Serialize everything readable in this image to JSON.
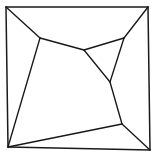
{
  "figure": {
    "background_color": "#ffffff",
    "line_color": "#181818",
    "line_width": 1.35,
    "canvas": {
      "width": 156,
      "height": 155
    }
  },
  "chart_data": {
    "type": "diagram",
    "subtype": "planar-graph",
    "xlabel": "",
    "ylabel": "",
    "xlim": [
      0,
      156
    ],
    "ylim": [
      0,
      155
    ],
    "grid": false,
    "legend": null,
    "vertices": [
      {
        "id": "c_tl",
        "label": "frame-top-left",
        "x": 6,
        "y": 7,
        "kind": "frame-corner"
      },
      {
        "id": "c_tr",
        "label": "frame-top-right",
        "x": 148,
        "y": 7,
        "kind": "frame-corner"
      },
      {
        "id": "c_br",
        "label": "frame-bottom-right",
        "x": 150,
        "y": 150,
        "kind": "frame-corner"
      },
      {
        "id": "c_bl",
        "label": "frame-bottom-left",
        "x": 8,
        "y": 147,
        "kind": "frame-corner"
      },
      {
        "id": "j_tl",
        "label": "junction-upper-left",
        "x": 40,
        "y": 38,
        "kind": "interior"
      },
      {
        "id": "j_tr",
        "label": "junction-upper-right",
        "x": 124,
        "y": 38,
        "kind": "interior"
      },
      {
        "id": "j_c",
        "label": "junction-center",
        "x": 84,
        "y": 50,
        "kind": "interior"
      },
      {
        "id": "j_mr",
        "label": "junction-mid-right",
        "x": 110,
        "y": 82,
        "kind": "interior"
      },
      {
        "id": "j_br",
        "label": "junction-lower-right",
        "x": 122,
        "y": 124,
        "kind": "interior"
      }
    ],
    "edges": [
      {
        "from": "c_tl",
        "to": "c_tr",
        "kind": "frame"
      },
      {
        "from": "c_tr",
        "to": "c_br",
        "kind": "frame"
      },
      {
        "from": "c_br",
        "to": "c_bl",
        "kind": "frame"
      },
      {
        "from": "c_bl",
        "to": "c_tl",
        "kind": "frame"
      },
      {
        "from": "c_tl",
        "to": "j_tl",
        "kind": "interior"
      },
      {
        "from": "c_tr",
        "to": "j_tr",
        "kind": "interior"
      },
      {
        "from": "j_tl",
        "to": "j_c",
        "kind": "interior"
      },
      {
        "from": "j_c",
        "to": "j_tr",
        "kind": "interior"
      },
      {
        "from": "j_c",
        "to": "j_mr",
        "kind": "interior"
      },
      {
        "from": "j_tr",
        "to": "j_mr",
        "kind": "interior"
      },
      {
        "from": "j_mr",
        "to": "j_br",
        "kind": "interior"
      },
      {
        "from": "j_tl",
        "to": "c_bl",
        "kind": "interior"
      },
      {
        "from": "c_bl",
        "to": "j_br",
        "kind": "interior"
      },
      {
        "from": "j_br",
        "to": "c_br",
        "kind": "interior"
      }
    ],
    "faces": [
      {
        "id": "f_top",
        "label": "top-face",
        "vertices": [
          "c_tl",
          "c_tr",
          "j_tr",
          "j_c",
          "j_tl"
        ]
      },
      {
        "id": "f_right",
        "label": "right-sliver-face",
        "vertices": [
          "j_c",
          "j_tr",
          "j_mr"
        ]
      },
      {
        "id": "f_east",
        "label": "east-face",
        "vertices": [
          "c_tr",
          "c_br",
          "j_br",
          "j_mr",
          "j_tr"
        ]
      },
      {
        "id": "f_center",
        "label": "central-face",
        "vertices": [
          "j_tl",
          "j_c",
          "j_mr",
          "j_br",
          "c_bl"
        ]
      },
      {
        "id": "f_left",
        "label": "left-face",
        "vertices": [
          "c_tl",
          "j_tl",
          "c_bl"
        ]
      },
      {
        "id": "f_bottom",
        "label": "bottom-face",
        "vertices": [
          "c_bl",
          "j_br",
          "c_br"
        ]
      }
    ],
    "counts": {
      "vertices": 9,
      "edges": 14,
      "faces": 6
    }
  }
}
